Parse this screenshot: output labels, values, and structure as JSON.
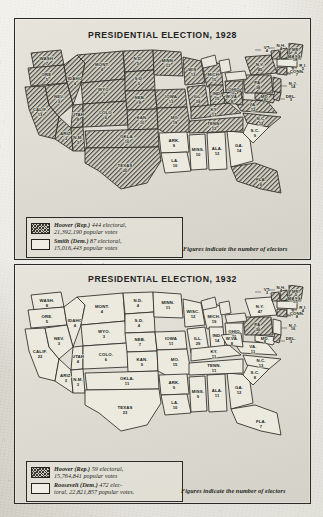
{
  "document": {
    "kind": "historical-atlas-page",
    "panels": [
      "1928",
      "1932"
    ]
  },
  "colors": {
    "paper": "#d8d6cd",
    "panel_fill": "#e0ded5",
    "ink": "#2b2a26",
    "republican_hatch": "#3a3832",
    "democrat_fill": "#eceadf"
  },
  "panel_1928": {
    "title": "PRESIDENTIAL ELECTION, 1928",
    "note": "Figures indicate the number of electors",
    "legend": [
      {
        "pattern": "hatched",
        "candidate": "Hoover (Rep.)",
        "electoral": "444 electoral,",
        "popular": "21,392,190 popular votes"
      },
      {
        "pattern": "white",
        "candidate": "Smith (Dem.)",
        "electoral": "87 electoral,",
        "popular": "15,016,443 popular votes"
      }
    ]
  },
  "panel_1932": {
    "title": "PRESIDENTIAL ELECTION, 1932",
    "note": "Figures indicate the number of electors",
    "legend": [
      {
        "pattern": "hatched",
        "candidate": "Hoover (Rep.)",
        "electoral": "59 electoral,",
        "popular": "15,764,841 popular votes"
      },
      {
        "pattern": "white",
        "candidate": "Roosevelt (Dem.)",
        "electoral": "472 elec-",
        "popular": "toral, 22,821,857 popular votes."
      }
    ]
  },
  "chart_data": {
    "type": "map",
    "value_label": "number of electors",
    "maps": [
      {
        "year": 1928,
        "title": "PRESIDENTIAL ELECTION, 1928",
        "winner_totals": {
          "Hoover (Rep.)": {
            "electoral": 444,
            "popular": 21392190
          },
          "Smith (Dem.)": {
            "electoral": 87,
            "popular": 15016443
          }
        },
        "states": [
          {
            "abbr": "WASH.",
            "electors": 7,
            "winner": "rep"
          },
          {
            "abbr": "ORE.",
            "electors": 5,
            "winner": "rep"
          },
          {
            "abbr": "CALIF.",
            "electors": 13,
            "winner": "rep"
          },
          {
            "abbr": "IDAHO",
            "electors": 4,
            "winner": "rep"
          },
          {
            "abbr": "NEV.",
            "electors": 3,
            "winner": "rep"
          },
          {
            "abbr": "MONT.",
            "electors": 4,
            "winner": "rep"
          },
          {
            "abbr": "WYO.",
            "electors": 3,
            "winner": "rep"
          },
          {
            "abbr": "UTAH",
            "electors": 4,
            "winner": "rep"
          },
          {
            "abbr": "ARIZ.",
            "electors": 3,
            "winner": "rep"
          },
          {
            "abbr": "COLO.",
            "electors": 6,
            "winner": "rep"
          },
          {
            "abbr": "N.M.",
            "electors": 3,
            "winner": "rep"
          },
          {
            "abbr": "N.D.",
            "electors": 5,
            "winner": "rep"
          },
          {
            "abbr": "S.D.",
            "electors": 5,
            "winner": "rep"
          },
          {
            "abbr": "NEB.",
            "electors": 8,
            "winner": "rep"
          },
          {
            "abbr": "KAN.",
            "electors": 10,
            "winner": "rep"
          },
          {
            "abbr": "OKLA.",
            "electors": 10,
            "winner": "rep"
          },
          {
            "abbr": "TEXAS",
            "electors": 20,
            "winner": "rep"
          },
          {
            "abbr": "MINN.",
            "electors": 12,
            "winner": "rep"
          },
          {
            "abbr": "IOWA",
            "electors": 13,
            "winner": "rep"
          },
          {
            "abbr": "MO.",
            "electors": 18,
            "winner": "rep"
          },
          {
            "abbr": "ARK.",
            "electors": 9,
            "winner": "dem"
          },
          {
            "abbr": "LA.",
            "electors": 10,
            "winner": "dem"
          },
          {
            "abbr": "MISS.",
            "electors": 10,
            "winner": "dem"
          },
          {
            "abbr": "ALA.",
            "electors": 12,
            "winner": "dem"
          },
          {
            "abbr": "GA.",
            "electors": 14,
            "winner": "dem"
          },
          {
            "abbr": "S.C.",
            "electors": 9,
            "winner": "dem"
          },
          {
            "abbr": "FLA.",
            "electors": 6,
            "winner": "rep"
          },
          {
            "abbr": "WIS.",
            "electors": 13,
            "winner": "rep"
          },
          {
            "abbr": "ILL.",
            "electors": 29,
            "winner": "rep"
          },
          {
            "abbr": "MICH.",
            "electors": 15,
            "winner": "rep"
          },
          {
            "abbr": "IND.",
            "electors": 15,
            "winner": "rep"
          },
          {
            "abbr": "OHIO",
            "electors": 24,
            "winner": "rep"
          },
          {
            "abbr": "KY.",
            "electors": 13,
            "winner": "rep"
          },
          {
            "abbr": "TENN.",
            "electors": 12,
            "winner": "rep"
          },
          {
            "abbr": "N.C.",
            "electors": 12,
            "winner": "rep"
          },
          {
            "abbr": "VA.",
            "electors": 12,
            "winner": "rep"
          },
          {
            "abbr": "W.VA.",
            "electors": 8,
            "winner": "rep"
          },
          {
            "abbr": "PA.",
            "electors": 38,
            "winner": "rep"
          },
          {
            "abbr": "N.Y.",
            "electors": 45,
            "winner": "rep"
          },
          {
            "abbr": "MD.",
            "electors": 8,
            "winner": "rep"
          },
          {
            "abbr": "DEL.",
            "electors": 3,
            "winner": "rep"
          },
          {
            "abbr": "N.J.",
            "electors": 14,
            "winner": "rep"
          },
          {
            "abbr": "CONN.",
            "electors": 7,
            "winner": "rep"
          },
          {
            "abbr": "R.I.",
            "electors": 5,
            "winner": "dem"
          },
          {
            "abbr": "MASS.",
            "electors": 18,
            "winner": "dem"
          },
          {
            "abbr": "VT.",
            "electors": 4,
            "winner": "rep"
          },
          {
            "abbr": "N.H.",
            "electors": 4,
            "winner": "rep"
          },
          {
            "abbr": "ME.",
            "electors": 6,
            "winner": "rep"
          }
        ]
      },
      {
        "year": 1932,
        "title": "PRESIDENTIAL ELECTION, 1932",
        "winner_totals": {
          "Hoover (Rep.)": {
            "electoral": 59,
            "popular": 15764841
          },
          "Roosevelt (Dem.)": {
            "electoral": 472,
            "popular": 22821857
          }
        },
        "states": [
          {
            "abbr": "WASH.",
            "electors": 8,
            "winner": "dem"
          },
          {
            "abbr": "ORE.",
            "electors": 5,
            "winner": "dem"
          },
          {
            "abbr": "CALIF.",
            "electors": 22,
            "winner": "dem"
          },
          {
            "abbr": "IDAHO",
            "electors": 4,
            "winner": "dem"
          },
          {
            "abbr": "NEV.",
            "electors": 3,
            "winner": "dem"
          },
          {
            "abbr": "MONT.",
            "electors": 4,
            "winner": "dem"
          },
          {
            "abbr": "WYO.",
            "electors": 3,
            "winner": "dem"
          },
          {
            "abbr": "UTAH",
            "electors": 4,
            "winner": "dem"
          },
          {
            "abbr": "ARIZ.",
            "electors": 3,
            "winner": "dem"
          },
          {
            "abbr": "COLO.",
            "electors": 6,
            "winner": "dem"
          },
          {
            "abbr": "N.M.",
            "electors": 3,
            "winner": "dem"
          },
          {
            "abbr": "N.D.",
            "electors": 4,
            "winner": "dem"
          },
          {
            "abbr": "S.D.",
            "electors": 4,
            "winner": "dem"
          },
          {
            "abbr": "NEB.",
            "electors": 7,
            "winner": "dem"
          },
          {
            "abbr": "KAN.",
            "electors": 9,
            "winner": "dem"
          },
          {
            "abbr": "OKLA.",
            "electors": 11,
            "winner": "dem"
          },
          {
            "abbr": "TEXAS",
            "electors": 23,
            "winner": "dem"
          },
          {
            "abbr": "MINN.",
            "electors": 11,
            "winner": "dem"
          },
          {
            "abbr": "IOWA",
            "electors": 11,
            "winner": "dem"
          },
          {
            "abbr": "MO.",
            "electors": 15,
            "winner": "dem"
          },
          {
            "abbr": "ARK.",
            "electors": 9,
            "winner": "dem"
          },
          {
            "abbr": "LA.",
            "electors": 10,
            "winner": "dem"
          },
          {
            "abbr": "MISS.",
            "electors": 9,
            "winner": "dem"
          },
          {
            "abbr": "ALA.",
            "electors": 11,
            "winner": "dem"
          },
          {
            "abbr": "GA.",
            "electors": 12,
            "winner": "dem"
          },
          {
            "abbr": "S.C.",
            "electors": 8,
            "winner": "dem"
          },
          {
            "abbr": "FLA.",
            "electors": 7,
            "winner": "dem"
          },
          {
            "abbr": "WISC.",
            "electors": 12,
            "winner": "dem"
          },
          {
            "abbr": "ILL.",
            "electors": 29,
            "winner": "dem"
          },
          {
            "abbr": "MICH.",
            "electors": 19,
            "winner": "dem"
          },
          {
            "abbr": "IND.",
            "electors": 14,
            "winner": "dem"
          },
          {
            "abbr": "OHIO",
            "electors": 26,
            "winner": "dem"
          },
          {
            "abbr": "KY.",
            "electors": 11,
            "winner": "dem"
          },
          {
            "abbr": "TENN.",
            "electors": 11,
            "winner": "dem"
          },
          {
            "abbr": "N.C.",
            "electors": 13,
            "winner": "dem"
          },
          {
            "abbr": "VA.",
            "electors": 11,
            "winner": "dem"
          },
          {
            "abbr": "W.VA.",
            "electors": 8,
            "winner": "dem"
          },
          {
            "abbr": "PA.",
            "electors": 36,
            "winner": "rep"
          },
          {
            "abbr": "N.Y.",
            "electors": 47,
            "winner": "dem"
          },
          {
            "abbr": "MD.",
            "electors": 8,
            "winner": "dem"
          },
          {
            "abbr": "DEL.",
            "electors": 3,
            "winner": "rep"
          },
          {
            "abbr": "N.J.",
            "electors": 16,
            "winner": "dem"
          },
          {
            "abbr": "CONN.",
            "electors": 8,
            "winner": "rep"
          },
          {
            "abbr": "R.I.",
            "electors": 4,
            "winner": "dem"
          },
          {
            "abbr": "MASS.",
            "electors": 17,
            "winner": "dem"
          },
          {
            "abbr": "VT.",
            "electors": 3,
            "winner": "rep"
          },
          {
            "abbr": "N.H.",
            "electors": 4,
            "winner": "rep"
          },
          {
            "abbr": "ME.",
            "electors": 5,
            "winner": "rep"
          }
        ]
      }
    ]
  }
}
